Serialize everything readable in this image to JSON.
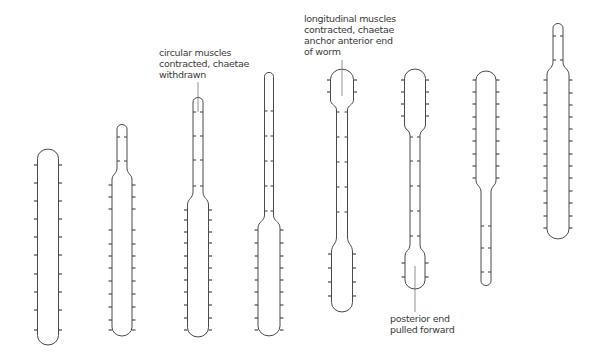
{
  "labels": {
    "circular": [
      "circular muscles",
      "contracted, chaetae",
      "withdrawn"
    ],
    "longitudinal": [
      "longitudinal muscles",
      "contracted, chaetae",
      "anchor anterior end",
      "of worm"
    ],
    "posterior": [
      "posterior end",
      "pulled forward"
    ]
  },
  "stroke_color": "#4a4a4a",
  "worm_stages": [
    {
      "stage": 1,
      "anterior": "none",
      "middle": "wide, resting",
      "posterior": "wide"
    },
    {
      "stage": 2,
      "anterior": "narrow, extending",
      "middle": "wide",
      "posterior": "wide"
    },
    {
      "stage": 3,
      "anterior": "narrow, extending further",
      "middle": "wide",
      "posterior": "wide"
    },
    {
      "stage": 4,
      "anterior": "narrow, long",
      "middle": "wide",
      "posterior": "wide"
    },
    {
      "stage": 5,
      "anterior": "wide, anchored",
      "middle": "narrow",
      "posterior": "wide"
    },
    {
      "stage": 6,
      "anterior": "wide, anchored",
      "middle": "narrow",
      "posterior": "wide, pulled forward"
    },
    {
      "stage": 7,
      "anterior": "wide, long",
      "middle": "narrow",
      "posterior": "narrow"
    },
    {
      "stage": 8,
      "anterior": "narrow, extending",
      "middle": "wide",
      "posterior": "wide"
    }
  ]
}
